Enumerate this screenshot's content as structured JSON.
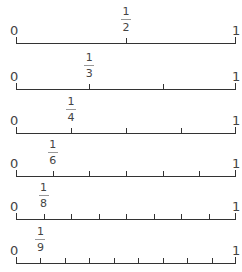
{
  "number_lines": [
    {
      "denominator": 2,
      "start_label": "0",
      "end_label": "1",
      "fraction": {
        "numerator": "1",
        "denominator": "2"
      },
      "baseline_y": 43
    },
    {
      "denominator": 3,
      "start_label": "0",
      "end_label": "1",
      "fraction": {
        "numerator": "1",
        "denominator": "3"
      },
      "baseline_y": 89
    },
    {
      "denominator": 4,
      "start_label": "0",
      "end_label": "1",
      "fraction": {
        "numerator": "1",
        "denominator": "4"
      },
      "baseline_y": 133
    },
    {
      "denominator": 6,
      "start_label": "0",
      "end_label": "1",
      "fraction": {
        "numerator": "1",
        "denominator": "6"
      },
      "baseline_y": 176
    },
    {
      "denominator": 8,
      "start_label": "0",
      "end_label": "1",
      "fraction": {
        "numerator": "1",
        "denominator": "8"
      },
      "baseline_y": 219
    },
    {
      "denominator": 9,
      "start_label": "0",
      "end_label": "1",
      "fraction": {
        "numerator": "1",
        "denominator": "9"
      },
      "baseline_y": 263
    }
  ],
  "colors": {
    "line": "#333333",
    "text": "#444444",
    "fraction_bar": "#999999"
  }
}
